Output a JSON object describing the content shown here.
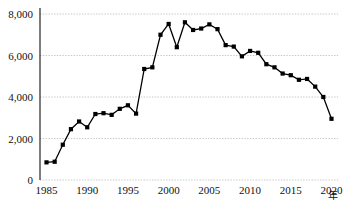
{
  "chart_data": {
    "type": "line",
    "title": "",
    "subtitle": "",
    "xlabel": "年",
    "ylabel": "",
    "xlim": [
      1984.2,
      2020.8
    ],
    "ylim": [
      0,
      8000
    ],
    "grid": true,
    "legend": false,
    "legend_position": "none",
    "marker": "square",
    "line_color": "#000000",
    "marker_color": "#000000",
    "grid_color": "#b9b9b9",
    "axis_color": "#111111",
    "background_color": "#ffffff",
    "x_tick_labels": [
      "1985",
      "1990",
      "1995",
      "2000",
      "2005",
      "2010",
      "2015",
      "2020"
    ],
    "x_tick_values": [
      1985,
      1990,
      1995,
      2000,
      2005,
      2010,
      2015,
      2020
    ],
    "y_tick_labels": [
      "0",
      "2,000",
      "4,000",
      "6,000",
      "8,000"
    ],
    "y_tick_values": [
      0,
      2000,
      4000,
      6000,
      8000
    ],
    "x": [
      1985,
      1986,
      1987,
      1988,
      1989,
      1990,
      1991,
      1992,
      1993,
      1994,
      1995,
      1996,
      1997,
      1998,
      1999,
      2000,
      2001,
      2002,
      2003,
      2004,
      2005,
      2006,
      2007,
      2008,
      2009,
      2010,
      2011,
      2012,
      2013,
      2014,
      2015,
      2016,
      2017,
      2018,
      2019,
      2020
    ],
    "values": [
      850,
      880,
      1700,
      2450,
      2820,
      2540,
      3180,
      3220,
      3140,
      3430,
      3600,
      3200,
      5350,
      5430,
      7000,
      7520,
      6400,
      7600,
      7230,
      7300,
      7500,
      7270,
      6500,
      6430,
      5960,
      6220,
      6130,
      5580,
      5430,
      5130,
      5050,
      4830,
      4870,
      4500,
      4000,
      2950
    ],
    "series": [
      {
        "name": "",
        "values": [
          850,
          880,
          1700,
          2450,
          2820,
          2540,
          3180,
          3220,
          3140,
          3430,
          3600,
          3200,
          5350,
          5430,
          7000,
          7520,
          6400,
          7600,
          7230,
          7300,
          7500,
          7270,
          6500,
          6430,
          5960,
          6220,
          6130,
          5580,
          5430,
          5130,
          5050,
          4830,
          4870,
          4500,
          4000,
          2950
        ]
      }
    ]
  }
}
